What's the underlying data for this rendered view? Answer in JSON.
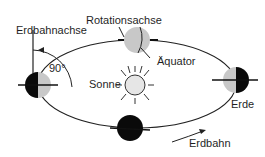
{
  "labels": {
    "orbit_axis": "Erdbahnachse",
    "rotation_axis": "Rotationsachse",
    "equator": "Äquator",
    "sun": "Sonne",
    "earth": "Erde",
    "orbit": "Erdbahn",
    "angle": "90°"
  },
  "colors": {
    "night": "#0a0a0a",
    "day": "#c8c8c8",
    "sun_fill": "#e6e6e6",
    "line": "#222222"
  }
}
